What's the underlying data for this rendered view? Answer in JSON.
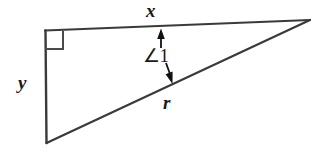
{
  "figure": {
    "type": "right-triangle-diagram",
    "background_color": "#ffffff",
    "stroke_color": "#333333",
    "label_color": "#1a1a1a",
    "labels": {
      "top_side": "x",
      "left_side": "y",
      "hypotenuse": "r",
      "angle": "∠1"
    },
    "markers": {
      "right_angle": "right-angle-square",
      "angle_indicator": "double-headed-arrow"
    },
    "vertices": {
      "top_left": [
        45,
        31
      ],
      "top_right": [
        310,
        20
      ],
      "bottom_left": [
        46,
        143
      ]
    }
  }
}
